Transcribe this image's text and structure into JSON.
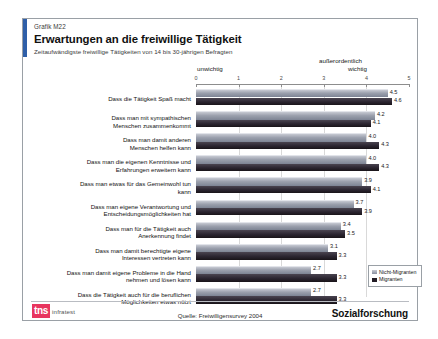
{
  "header": {
    "graphic_id": "Grafik M22",
    "title": "Erwartungen an die freiwillige Tätigkeit",
    "subtitle": "Zeitaufwändigste freiwillige Tätigkeiten von 14 bis 30-jährigen Befragten"
  },
  "axis_captions": {
    "left": "unwichtig",
    "right_line1": "außerordentlich",
    "right_line2": "wichtig"
  },
  "legend": {
    "items": [
      {
        "label": "Nicht-Migranten",
        "color": "#9ba0ad"
      },
      {
        "label": "Migranten",
        "color": "#231d26"
      }
    ]
  },
  "footer": {
    "logo_mark": "tns",
    "logo_word": "infratest",
    "source": "Quelle: Freiwilligensurvey 2004",
    "division": "Sozialforschung"
  },
  "chart_data": {
    "type": "bar",
    "orientation": "horizontal",
    "title": "Erwartungen an die freiwillige Tätigkeit",
    "subtitle": "Zeitaufwändigste freiwillige Tätigkeiten von 14 bis 30-jährigen Befragten",
    "xlabel": "",
    "ylabel": "",
    "xlim": [
      0,
      5
    ],
    "xticks": [
      0,
      1,
      2,
      3,
      4,
      5
    ],
    "xtick_labels": [
      "0",
      "1",
      "2",
      "3",
      "4",
      "5"
    ],
    "scale_low_label": "unwichtig",
    "scale_high_label": "außerordentlich wichtig",
    "grid": true,
    "legend_position": "right-bottom",
    "categories": [
      [
        "Dass die Tätigkeit Spaß macht"
      ],
      [
        "Dass man mit sympathischen",
        "Menschen zusammenkommt"
      ],
      [
        "Dass man damit anderen",
        "Menschen helfen kann"
      ],
      [
        "Dass man die eigenen Kenntnisse und",
        "Erfahrungen erweitern kann"
      ],
      [
        "Dass man etwas für das Gemeinwohl tun",
        "kann"
      ],
      [
        "Dass man eigene Verantwortung und",
        "Entscheidungsmöglichkeiten hat"
      ],
      [
        "Dass man für die Tätigkeit auch",
        "Anerkennung findet"
      ],
      [
        "Dass man damit berechtigte eigene",
        "Interessen vertreten kann"
      ],
      [
        "Dass man damit eigene Probleme in die Hand",
        "nehmen und lösen kann"
      ],
      [
        "Dass die Tätigkeit auch für die beruflichen",
        "Möglichkeiten etwas nützt"
      ]
    ],
    "series": [
      {
        "name": "Nicht-Migranten",
        "values": [
          4.5,
          4.2,
          4.0,
          4.0,
          3.9,
          3.7,
          3.4,
          3.1,
          2.7,
          2.7
        ]
      },
      {
        "name": "Migranten",
        "values": [
          4.6,
          4.1,
          4.3,
          4.3,
          4.1,
          3.9,
          3.5,
          3.3,
          3.3,
          3.3
        ]
      }
    ]
  }
}
